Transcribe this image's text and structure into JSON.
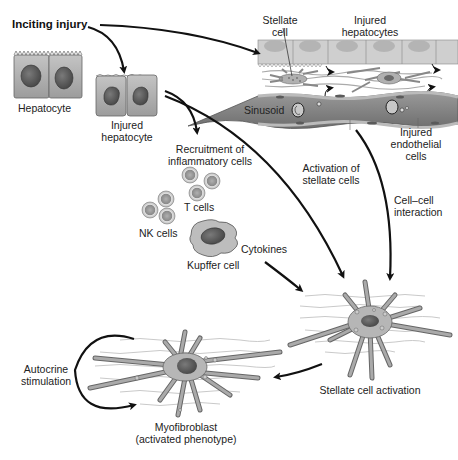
{
  "diagram": {
    "type": "flow",
    "labels": {
      "inciting_injury": "Inciting injury",
      "hepatocyte": "Hepatocyte",
      "injured_hepatocyte_1": "Injured",
      "injured_hepatocyte_2": "hepatocyte",
      "stellate_cell_1": "Stellate",
      "stellate_cell_2": "cell",
      "injured_hepatocytes_1": "Injured",
      "injured_hepatocytes_2": "hepatocytes",
      "sinusoid": "Sinusoid",
      "injured_endothelial_1": "Injured",
      "injured_endothelial_2": "endothelial",
      "injured_endothelial_3": "cells",
      "recruitment_1": "Recruitment of",
      "recruitment_2": "inflammatory cells",
      "t_cells": "T cells",
      "nk_cells": "NK cells",
      "kupffer_cell": "Kupffer cell",
      "cytokines": "Cytokines",
      "activation_stellate_1": "Activation of",
      "activation_stellate_2": "stellate cells",
      "cell_cell_1": "Cell–cell",
      "cell_cell_2": "interaction",
      "stellate_activation": "Stellate cell activation",
      "autocrine_1": "Autocrine",
      "autocrine_2": "stimulation",
      "myofibroblast_1": "Myofibroblast",
      "myofibroblast_2": "(activated phenotype)"
    },
    "nodes": [
      "Inciting injury",
      "Hepatocyte",
      "Injured hepatocyte",
      "Sinusoid tissue (stellate cell, injured hepatocytes, injured endothelial cells)",
      "Recruitment of inflammatory cells (T cells, NK cells, Kupffer cell)",
      "Stellate cell activation",
      "Myofibroblast (activated phenotype)"
    ],
    "edges": [
      {
        "from": "Inciting injury",
        "to": "Injured hepatocyte"
      },
      {
        "from": "Inciting injury",
        "to": "Sinusoid tissue"
      },
      {
        "from": "Injured hepatocyte",
        "to": "Recruitment of inflammatory cells"
      },
      {
        "from": "Injured hepatocyte",
        "to": "Stellate cell activation",
        "label": "Activation of stellate cells"
      },
      {
        "from": "Sinusoid tissue",
        "to": "Stellate cell activation",
        "label": "Cell–cell interaction"
      },
      {
        "from": "Kupffer cell",
        "to": "Stellate cell activation",
        "label": "Cytokines"
      },
      {
        "from": "Stellate cell activation",
        "to": "Myofibroblast"
      },
      {
        "from": "Myofibroblast",
        "to": "Myofibroblast",
        "label": "Autocrine stimulation"
      }
    ],
    "colors": {
      "cell_fill": "#a8a8a8",
      "cell_light": "#d0d0d0",
      "nucleus": "#5a5a5a",
      "arrow": "#111111",
      "text": "#222222"
    }
  }
}
